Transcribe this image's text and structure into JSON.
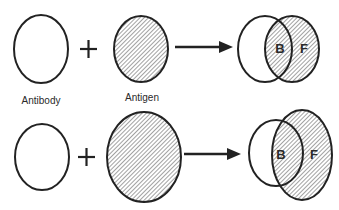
{
  "diagram": {
    "colors": {
      "stroke": "#222222",
      "hatch": "#555555",
      "background": "#ffffff"
    },
    "labels": {
      "antibody": "Antibody",
      "antigen": "Antigen",
      "plus": "+",
      "bound": "B",
      "free": "F"
    },
    "rows": [
      {
        "id": "small-antigen",
        "antibody": {
          "cx": 41,
          "cy": 49,
          "rx": 27,
          "ry": 34
        },
        "plus": {
          "x": 88,
          "y": 49
        },
        "antigen": {
          "cx": 141,
          "cy": 49,
          "rx": 27,
          "ry": 33
        },
        "arrow": {
          "x1": 175,
          "x2": 232,
          "y": 47
        },
        "complex": {
          "antibody": {
            "cx": 265,
            "cy": 49,
            "rx": 27,
            "ry": 33
          },
          "antigen": {
            "cx": 292,
            "cy": 49,
            "rx": 27,
            "ry": 33
          },
          "b_label_pos": [
            280,
            52
          ],
          "f_label_pos": [
            304,
            52
          ]
        }
      },
      {
        "id": "large-antigen",
        "antibody": {
          "cx": 42,
          "cy": 157,
          "rx": 27,
          "ry": 33
        },
        "plus": {
          "x": 86,
          "y": 157
        },
        "antigen": {
          "cx": 144,
          "cy": 157,
          "rx": 37,
          "ry": 45
        },
        "arrow": {
          "x1": 184,
          "x2": 241,
          "y": 154
        },
        "complex": {
          "antibody": {
            "cx": 276,
            "cy": 153,
            "rx": 27,
            "ry": 33
          },
          "antigen": {
            "cx": 302,
            "cy": 155,
            "rx": 30,
            "ry": 45
          },
          "b_label_pos": [
            281,
            159
          ],
          "f_label_pos": [
            314,
            159
          ]
        }
      }
    ]
  }
}
